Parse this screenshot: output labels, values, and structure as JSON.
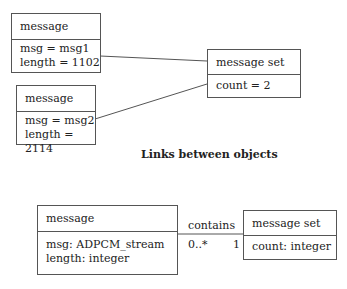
{
  "object_diagram": {
    "objects": [
      {
        "name": "message",
        "attributes": [
          "msg = msg1",
          "length = 1102"
        ]
      },
      {
        "name": "message",
        "attributes": [
          "msg = msg2",
          "length = 2114"
        ]
      },
      {
        "name": "message set",
        "attributes": [
          "count = 2"
        ]
      }
    ],
    "links": [
      {
        "from": "message (msg1)",
        "to": "message set"
      },
      {
        "from": "message (msg2)",
        "to": "message set"
      }
    ],
    "caption": "Links between objects"
  },
  "class_diagram": {
    "classes": [
      {
        "name": "message",
        "attributes": [
          "msg: ADPCM_stream",
          "length: integer"
        ]
      },
      {
        "name": "message set",
        "attributes": [
          "count: integer"
        ]
      }
    ],
    "association": {
      "name": "contains",
      "multiplicity_message": "0..*",
      "multiplicity_set": "1"
    }
  },
  "colors": {
    "line": "#555555",
    "text": "#222222",
    "background": "#ffffff"
  }
}
